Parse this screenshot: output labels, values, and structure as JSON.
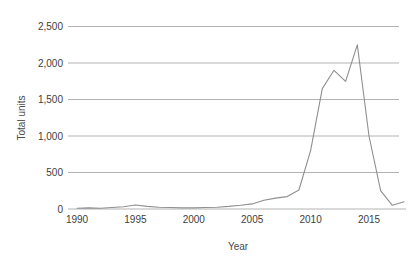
{
  "chart_data": {
    "type": "line",
    "title": "",
    "xlabel": "Year",
    "ylabel": "Total units",
    "x": [
      1990,
      1991,
      1992,
      1993,
      1994,
      1995,
      1996,
      1997,
      1998,
      1999,
      2000,
      2001,
      2002,
      2003,
      2004,
      2005,
      2006,
      2007,
      2008,
      2009,
      2010,
      2011,
      2012,
      2013,
      2014,
      2015,
      2016,
      2017,
      2018
    ],
    "values": [
      10,
      15,
      10,
      20,
      30,
      55,
      35,
      25,
      20,
      15,
      15,
      20,
      25,
      35,
      50,
      70,
      120,
      150,
      170,
      260,
      800,
      1650,
      1900,
      1750,
      2250,
      1000,
      250,
      50,
      100
    ],
    "series_name": "Total units",
    "xlim": [
      1990,
      2018.3
    ],
    "ylim": [
      0,
      2500
    ],
    "grid": "horizontal",
    "legend": "none",
    "x_ticks": [
      {
        "value": 1990,
        "label": "1990"
      },
      {
        "value": 1995,
        "label": "1995"
      },
      {
        "value": 2000,
        "label": "2000"
      },
      {
        "value": 2005,
        "label": "2005"
      },
      {
        "value": 2010,
        "label": "2010"
      },
      {
        "value": 2015,
        "label": "2015"
      }
    ],
    "y_ticks": [
      {
        "value": 0,
        "label": "0"
      },
      {
        "value": 500,
        "label": "500"
      },
      {
        "value": 1000,
        "label": "1,000"
      },
      {
        "value": 1500,
        "label": "1,500"
      },
      {
        "value": 2000,
        "label": "2,000"
      },
      {
        "value": 2500,
        "label": "2,500"
      }
    ],
    "colors": {
      "line": "#8f8f8f",
      "grid": "#b3b3b3",
      "text": "#3d3d3d",
      "background": "#ffffff"
    }
  }
}
